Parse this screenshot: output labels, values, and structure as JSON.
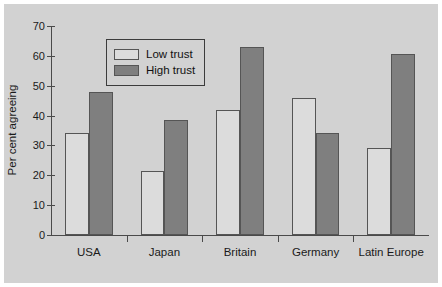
{
  "chart_data": {
    "type": "bar",
    "title": "",
    "subtitle": "",
    "xlabel": "",
    "ylabel": "Per cent agreeing",
    "categories": [
      "USA",
      "Japan",
      "Britain",
      "Germany",
      "Latin Europe"
    ],
    "series": [
      {
        "name": "Low trust",
        "color": "#dcdcdc",
        "values": [
          34,
          21.5,
          42,
          46,
          29
        ]
      },
      {
        "name": "High trust",
        "color": "#7f7f7f",
        "values": [
          48,
          38.5,
          63,
          34,
          60.5
        ]
      }
    ],
    "ylim": [
      0,
      70
    ],
    "ytick_values": [
      0,
      10,
      20,
      30,
      40,
      50,
      60,
      70
    ],
    "ytick_labels": [
      "0",
      "10",
      "20",
      "30",
      "40",
      "50",
      "60",
      "70"
    ],
    "grid": false,
    "legend_position": "upper-left-inside",
    "legend_entries": [
      "Low trust",
      "High trust"
    ],
    "background_color": "#d2d2d2",
    "axis_color": "#4a4a4a",
    "bar_edge_color": "#555555"
  }
}
